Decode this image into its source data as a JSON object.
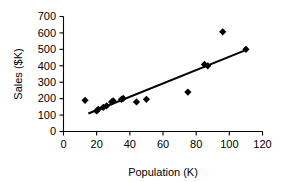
{
  "chart_data": {
    "type": "scatter",
    "title": "",
    "xlabel": "Population (K)",
    "ylabel": "Sales ($K)",
    "xlim": [
      0,
      120
    ],
    "ylim": [
      0,
      700
    ],
    "xticks": [
      0,
      20,
      40,
      60,
      80,
      100,
      120
    ],
    "yticks": [
      0,
      100,
      200,
      300,
      400,
      500,
      600,
      700
    ],
    "xtick_labels": [
      "0",
      "20",
      "40",
      "60",
      "80",
      "100",
      "120"
    ],
    "ytick_labels": [
      "0",
      "100",
      "200",
      "300",
      "400",
      "500",
      "600",
      "700"
    ],
    "grid": false,
    "legend": false,
    "marker_style": "diamond",
    "marker_color": "#000000",
    "series": [
      {
        "name": "Sales vs Population",
        "points": [
          {
            "x": 13,
            "y": 190
          },
          {
            "x": 20,
            "y": 125
          },
          {
            "x": 21,
            "y": 135
          },
          {
            "x": 24,
            "y": 147
          },
          {
            "x": 26,
            "y": 156
          },
          {
            "x": 29,
            "y": 180
          },
          {
            "x": 30,
            "y": 186
          },
          {
            "x": 35,
            "y": 196
          },
          {
            "x": 36,
            "y": 202
          },
          {
            "x": 44,
            "y": 180
          },
          {
            "x": 50,
            "y": 196
          },
          {
            "x": 75,
            "y": 240
          },
          {
            "x": 85,
            "y": 408
          },
          {
            "x": 87,
            "y": 400
          },
          {
            "x": 96,
            "y": 607
          },
          {
            "x": 110,
            "y": 500
          }
        ]
      }
    ],
    "trendline": {
      "type": "linear",
      "x_start": 15,
      "y_start": 110,
      "x_end": 111,
      "y_end": 500,
      "color": "#000000"
    }
  },
  "axes": {
    "x_axis_name": "x-axis",
    "y_axis_name": "y-axis"
  }
}
